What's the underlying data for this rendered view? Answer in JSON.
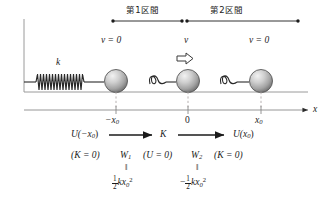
{
  "diagram": {
    "title_sections": [
      {
        "label": "第1区間",
        "name": "section-1"
      },
      {
        "label": "第2区間",
        "name": "section-2"
      }
    ],
    "velocity_labels": [
      {
        "text": "v = 0",
        "name": "velocity-label-left"
      },
      {
        "text": "v",
        "name": "velocity-label-middle"
      },
      {
        "text": "v = 0",
        "name": "velocity-label-right"
      }
    ],
    "spring_constant_label": "k",
    "axis": {
      "name": "x-axis",
      "axis_label": "x",
      "ticks": [
        {
          "label": "−x",
          "sub": "0",
          "name": "tick-minus-x0"
        },
        {
          "label": "0",
          "sub": "",
          "name": "tick-zero"
        },
        {
          "label": "x",
          "sub": "0",
          "name": "tick-x0"
        }
      ]
    },
    "energy_row": {
      "left": {
        "fn": "U(−x",
        "sub": "0",
        "close": ")"
      },
      "middle": "K",
      "right": {
        "fn": "U(x",
        "sub": "0",
        "close": ")"
      }
    },
    "condition_row": [
      {
        "text": "(K = 0)",
        "name": "condition-left"
      },
      {
        "text": "W",
        "sub": "1",
        "name": "work-1"
      },
      {
        "text": "(U = 0)",
        "name": "condition-middle"
      },
      {
        "text": "W",
        "sub": "2",
        "name": "work-2"
      },
      {
        "text": "(K = 0)",
        "name": "condition-right"
      }
    ],
    "equals_marks": [
      {
        "text": "‖",
        "name": "equals-mark-1"
      },
      {
        "text": "‖",
        "name": "equals-mark-2"
      }
    ],
    "work_values": [
      {
        "sign": "",
        "num": "1",
        "den": "2",
        "expr": "kx",
        "sub": "0",
        "sup": "2",
        "name": "work-value-1"
      },
      {
        "sign": "−",
        "num": "1",
        "den": "2",
        "expr": "kx",
        "sub": "0",
        "sup": "2",
        "name": "work-value-2"
      }
    ],
    "colors": {
      "ink": "#1b1b1b",
      "rule": "#8a8a8a",
      "ball_dark": "#6e6e6e",
      "ball_light": "#e8e8e8",
      "spring": "#2a2a2a"
    }
  }
}
